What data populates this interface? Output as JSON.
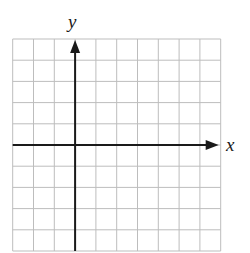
{
  "diagram": {
    "type": "coordinate-grid",
    "x_axis_label": "x",
    "y_axis_label": "y",
    "grid": {
      "columns": 10,
      "rows": 10,
      "y_axis_column_index": 3,
      "x_axis_row_index": 5,
      "left": 12.7,
      "top": 39,
      "cell_width": 20.8,
      "cell_height": 21.2
    },
    "colors": {
      "grid_line": "#bdbdbd",
      "axis": "#1a1a1a",
      "background": "#ffffff"
    }
  }
}
